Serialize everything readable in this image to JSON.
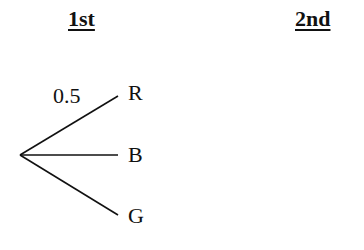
{
  "headers": {
    "first": "1st",
    "second": "2nd"
  },
  "tree": {
    "branches": [
      {
        "label": "R",
        "probability": "0.5"
      },
      {
        "label": "B",
        "probability": ""
      },
      {
        "label": "G",
        "probability": ""
      }
    ]
  },
  "colors": {
    "line": "#111111",
    "background": "#ffffff"
  }
}
